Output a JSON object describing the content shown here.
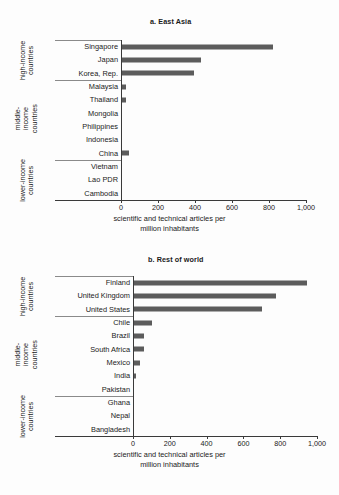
{
  "figure": {
    "background": "#fdfdfd",
    "bar_color": "#5c5c5c",
    "axis_color": "#3a3a3a"
  },
  "chart_data": [
    {
      "type": "bar",
      "orientation": "horizontal",
      "title": "a. East Asia",
      "xlabel": "scientific and technical articles per million inhabitants",
      "ylabel": "",
      "xlim": [
        0,
        1000
      ],
      "xticks": [
        0,
        200,
        400,
        600,
        800,
        1000
      ],
      "xticklabels": [
        "0",
        "200",
        "400",
        "600",
        "800",
        "1,000"
      ],
      "grid": false,
      "legend": "none",
      "groups": [
        {
          "label": "high-income\ncountries",
          "categories": [
            "Singapore",
            "Japan",
            "Korea, Rep."
          ],
          "values": [
            822,
            432,
            393
          ]
        },
        {
          "label": "middle-\nincome\ncountries",
          "categories": [
            "Malaysia",
            "Thailand",
            "Mongolia",
            "Philippines",
            "Indonesia",
            "China"
          ],
          "values": [
            27,
            25,
            6,
            2,
            1,
            43
          ]
        },
        {
          "label": "lower-income\ncountries",
          "categories": [
            "Vietnam",
            "Lao PDR",
            "Cambodia"
          ],
          "values": [
            3,
            1,
            1
          ]
        }
      ],
      "categories": [
        "Singapore",
        "Japan",
        "Korea, Rep.",
        "Malaysia",
        "Thailand",
        "Mongolia",
        "Philippines",
        "Indonesia",
        "China",
        "Vietnam",
        "Lao PDR",
        "Cambodia"
      ],
      "values": [
        822,
        432,
        393,
        27,
        25,
        6,
        2,
        1,
        43,
        3,
        1,
        1
      ]
    },
    {
      "type": "bar",
      "orientation": "horizontal",
      "title": "b. Rest of world",
      "xlabel": "scientific and technical articles per million inhabitants",
      "ylabel": "",
      "xlim": [
        0,
        1000
      ],
      "xticks": [
        0,
        200,
        400,
        600,
        800,
        1000
      ],
      "xticklabels": [
        "0",
        "200",
        "400",
        "600",
        "800",
        "1,000"
      ],
      "grid": false,
      "legend": "none",
      "groups": [
        {
          "label": "high-income\ncountries",
          "categories": [
            "Finland",
            "United Kingdom",
            "United States"
          ],
          "values": [
            945,
            775,
            700
          ]
        },
        {
          "label": "middle-\nincome\ncountries",
          "categories": [
            "Chile",
            "Brazil",
            "South Africa",
            "Mexico",
            "India",
            "Pakistan"
          ],
          "values": [
            105,
            62,
            60,
            40,
            15,
            5
          ]
        },
        {
          "label": "lower-income\ncountries",
          "categories": [
            "Ghana",
            "Nepal",
            "Bangladesh"
          ],
          "values": [
            4,
            3,
            2
          ]
        }
      ],
      "categories": [
        "Finland",
        "United Kingdom",
        "United States",
        "Chile",
        "Brazil",
        "South Africa",
        "Mexico",
        "India",
        "Pakistan",
        "Ghana",
        "Nepal",
        "Bangladesh"
      ],
      "values": [
        945,
        775,
        700,
        105,
        62,
        60,
        40,
        15,
        5,
        4,
        3,
        2
      ]
    }
  ],
  "panel_a": {
    "title": "a. East Asia",
    "axis_title_line1": "scientific and technical articles per",
    "axis_title_line2": "million inhabitants",
    "ticklabels": [
      "0",
      "200",
      "400",
      "600",
      "800",
      "1,000"
    ],
    "group_labels": [
      "high-income\ncountries",
      "middle-\nincome\ncountries",
      "lower-income\ncountries"
    ],
    "rows": [
      {
        "label": "Singapore",
        "value": 822
      },
      {
        "label": "Japan",
        "value": 432
      },
      {
        "label": "Korea, Rep.",
        "value": 393
      },
      {
        "label": "Malaysia",
        "value": 27
      },
      {
        "label": "Thailand",
        "value": 25
      },
      {
        "label": "Mongolia",
        "value": 6
      },
      {
        "label": "Philippines",
        "value": 2
      },
      {
        "label": "Indonesia",
        "value": 1
      },
      {
        "label": "China",
        "value": 43
      },
      {
        "label": "Vietnam",
        "value": 3
      },
      {
        "label": "Lao PDR",
        "value": 1
      },
      {
        "label": "Cambodia",
        "value": 1
      }
    ]
  },
  "panel_b": {
    "title": "b. Rest of world",
    "axis_title_line1": "scientific and technical articles per",
    "axis_title_line2": "million inhabitants",
    "ticklabels": [
      "0",
      "200",
      "400",
      "600",
      "800",
      "1,000"
    ],
    "group_labels": [
      "high-income\ncountries",
      "middle-\nincome\ncountries",
      "lower-income\ncountries"
    ],
    "rows": [
      {
        "label": "Finland",
        "value": 945
      },
      {
        "label": "United Kingdom",
        "value": 775
      },
      {
        "label": "United States",
        "value": 700
      },
      {
        "label": "Chile",
        "value": 105
      },
      {
        "label": "Brazil",
        "value": 62
      },
      {
        "label": "South Africa",
        "value": 60
      },
      {
        "label": "Mexico",
        "value": 40
      },
      {
        "label": "India",
        "value": 15
      },
      {
        "label": "Pakistan",
        "value": 5
      },
      {
        "label": "Ghana",
        "value": 4
      },
      {
        "label": "Nepal",
        "value": 3
      },
      {
        "label": "Bangladesh",
        "value": 2
      }
    ]
  }
}
